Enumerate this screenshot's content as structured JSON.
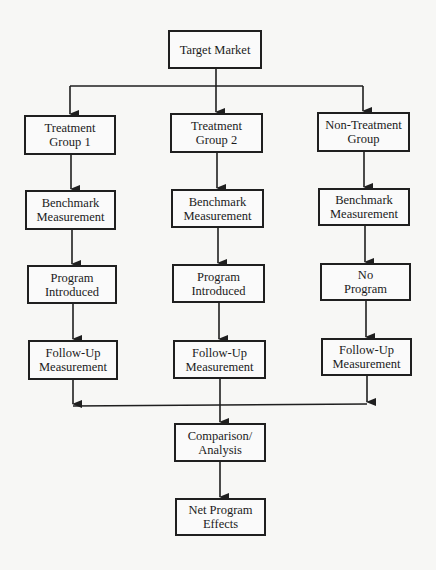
{
  "diagram": {
    "type": "flowchart",
    "nodes": {
      "target_market": {
        "label": "Target Market"
      },
      "treatment_group_1": {
        "label": "Treatment\nGroup 1"
      },
      "treatment_group_2": {
        "label": "Treatment\nGroup 2"
      },
      "non_treatment_group": {
        "label": "Non-Treatment\nGroup"
      },
      "benchmark_1": {
        "label": "Benchmark\nMeasurement"
      },
      "benchmark_2": {
        "label": "Benchmark\nMeasurement"
      },
      "benchmark_3": {
        "label": "Benchmark\nMeasurement"
      },
      "program_introduced_1": {
        "label": "Program\nIntroduced"
      },
      "program_introduced_2": {
        "label": "Program\nIntroduced"
      },
      "no_program": {
        "label": "No\nProgram"
      },
      "follow_up_1": {
        "label": "Follow-Up\nMeasurement"
      },
      "follow_up_2": {
        "label": "Follow-Up\nMeasurement"
      },
      "follow_up_3": {
        "label": "Follow-Up\nMeasurement"
      },
      "comparison_analysis": {
        "label": "Comparison/\nAnalysis"
      },
      "net_program_effects": {
        "label": "Net Program\nEffects"
      }
    },
    "edges": [
      [
        "target_market",
        "treatment_group_1"
      ],
      [
        "target_market",
        "treatment_group_2"
      ],
      [
        "target_market",
        "non_treatment_group"
      ],
      [
        "treatment_group_1",
        "benchmark_1"
      ],
      [
        "treatment_group_2",
        "benchmark_2"
      ],
      [
        "non_treatment_group",
        "benchmark_3"
      ],
      [
        "benchmark_1",
        "program_introduced_1"
      ],
      [
        "benchmark_2",
        "program_introduced_2"
      ],
      [
        "benchmark_3",
        "no_program"
      ],
      [
        "program_introduced_1",
        "follow_up_1"
      ],
      [
        "program_introduced_2",
        "follow_up_2"
      ],
      [
        "no_program",
        "follow_up_3"
      ],
      [
        "follow_up_1",
        "comparison_analysis"
      ],
      [
        "follow_up_2",
        "comparison_analysis"
      ],
      [
        "follow_up_3",
        "comparison_analysis"
      ],
      [
        "comparison_analysis",
        "net_program_effects"
      ]
    ],
    "colors": {
      "line": "#1f1f1f",
      "background": "#f7f7f5",
      "box_fill": "#fafafa"
    }
  }
}
